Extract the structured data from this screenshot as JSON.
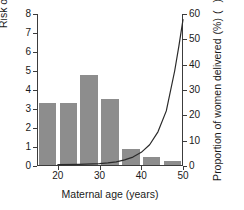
{
  "chart_data": {
    "type": "bar",
    "title": "",
    "xlabel": "Maternal age (years)",
    "ylabel": "Risk of Down's syndrome (%)",
    "ylabel_right": "Proportion of women delivered",
    "ylabel_right_unit": "(%)",
    "xlim": [
      15,
      50
    ],
    "ylim": [
      0,
      8
    ],
    "ylim_right": [
      0,
      60
    ],
    "grid": false,
    "legend_position": "axis-labels",
    "xticks": [
      20,
      30,
      40,
      50
    ],
    "yticks_left": [
      0,
      1,
      2,
      3,
      4,
      5,
      6,
      7,
      8
    ],
    "yticks_right": [
      0,
      10,
      20,
      30,
      40,
      50,
      60
    ],
    "bar_color": "#8d8d8d",
    "line_color": "#2a2a2a",
    "series": [
      {
        "name": "Proportion of women delivered",
        "type": "bar",
        "axis": "right",
        "unit": "%",
        "categories": [
          "15-20",
          "20-25",
          "25-30",
          "30-35",
          "35-40",
          "40-45",
          "45-50"
        ],
        "x": [
          17.5,
          22.5,
          27.5,
          32.5,
          37.5,
          42.5,
          47.5
        ],
        "values": [
          24.5,
          24.5,
          35.5,
          26.0,
          6.5,
          3.0,
          1.5
        ]
      },
      {
        "name": "Risk of Down's syndrome",
        "type": "line",
        "axis": "left",
        "unit": "%",
        "x": [
          20,
          25,
          30,
          32,
          34,
          36,
          38,
          40,
          42,
          44,
          46,
          48,
          49,
          50
        ],
        "values": [
          0.07,
          0.09,
          0.12,
          0.16,
          0.22,
          0.32,
          0.47,
          0.72,
          1.12,
          1.8,
          2.9,
          5.0,
          6.3,
          7.7
        ]
      }
    ],
    "annotations": []
  },
  "axis_titles": {
    "left": "Risk of Down's syndrome (%)",
    "right_main": "Proportion of women delivered",
    "right_unit": "(%)",
    "bottom": "Maternal age (years)"
  },
  "legend_keys": {
    "line_key_name": "line-marker",
    "bar_key_name": "bar-swatch"
  }
}
